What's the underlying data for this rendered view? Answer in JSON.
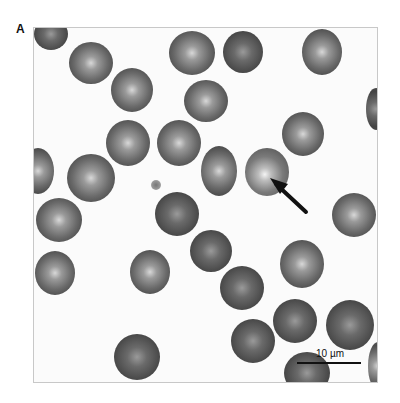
{
  "figure": {
    "panel_label": "A",
    "scale_bar": {
      "label": "10 µm"
    }
  },
  "cells": [
    {
      "x": 0,
      "y": -10,
      "w": 34,
      "h": 32,
      "variant": "dark"
    },
    {
      "x": 35,
      "y": 14,
      "w": 44,
      "h": 42,
      "variant": ""
    },
    {
      "x": 77,
      "y": 40,
      "w": 42,
      "h": 44,
      "variant": ""
    },
    {
      "x": 135,
      "y": 3,
      "w": 46,
      "h": 44,
      "variant": ""
    },
    {
      "x": 150,
      "y": 52,
      "w": 44,
      "h": 42,
      "variant": ""
    },
    {
      "x": 189,
      "y": 3,
      "w": 40,
      "h": 42,
      "variant": "dark"
    },
    {
      "x": 268,
      "y": 1,
      "w": 40,
      "h": 46,
      "variant": ""
    },
    {
      "x": 332,
      "y": 60,
      "w": 20,
      "h": 42,
      "variant": "dark"
    },
    {
      "x": 72,
      "y": 92,
      "w": 44,
      "h": 46,
      "variant": ""
    },
    {
      "x": 123,
      "y": 92,
      "w": 44,
      "h": 46,
      "variant": ""
    },
    {
      "x": -12,
      "y": 120,
      "w": 32,
      "h": 46,
      "variant": ""
    },
    {
      "x": 33,
      "y": 126,
      "w": 48,
      "h": 48,
      "variant": ""
    },
    {
      "x": 167,
      "y": 118,
      "w": 36,
      "h": 50,
      "variant": ""
    },
    {
      "x": 211,
      "y": 120,
      "w": 44,
      "h": 48,
      "variant": "bright"
    },
    {
      "x": 248,
      "y": 84,
      "w": 42,
      "h": 44,
      "variant": ""
    },
    {
      "x": 2,
      "y": 170,
      "w": 46,
      "h": 44,
      "variant": ""
    },
    {
      "x": 121,
      "y": 164,
      "w": 44,
      "h": 44,
      "variant": "dark"
    },
    {
      "x": 298,
      "y": 165,
      "w": 44,
      "h": 44,
      "variant": ""
    },
    {
      "x": 156,
      "y": 202,
      "w": 42,
      "h": 42,
      "variant": "dark"
    },
    {
      "x": 1,
      "y": 223,
      "w": 40,
      "h": 44,
      "variant": ""
    },
    {
      "x": 96,
      "y": 222,
      "w": 40,
      "h": 44,
      "variant": ""
    },
    {
      "x": 246,
      "y": 212,
      "w": 44,
      "h": 48,
      "variant": ""
    },
    {
      "x": 186,
      "y": 238,
      "w": 44,
      "h": 44,
      "variant": "dark"
    },
    {
      "x": 239,
      "y": 271,
      "w": 44,
      "h": 44,
      "variant": "dark"
    },
    {
      "x": 292,
      "y": 272,
      "w": 48,
      "h": 50,
      "variant": "dark"
    },
    {
      "x": 197,
      "y": 291,
      "w": 44,
      "h": 44,
      "variant": "dark"
    },
    {
      "x": 250,
      "y": 324,
      "w": 46,
      "h": 42,
      "variant": "dark"
    },
    {
      "x": 334,
      "y": 314,
      "w": 20,
      "h": 48,
      "variant": ""
    },
    {
      "x": 80,
      "y": 306,
      "w": 46,
      "h": 46,
      "variant": "dark"
    }
  ],
  "debris": [
    {
      "x": 117,
      "y": 152,
      "w": 10,
      "h": 10
    }
  ]
}
